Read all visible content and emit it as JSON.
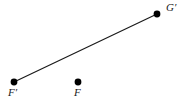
{
  "figure": {
    "width": 189,
    "height": 104,
    "background_color": "#ffffff",
    "stroke_color": "#1a1a1a",
    "points": [
      {
        "id": "F-prime",
        "label": "F′",
        "cx": 14,
        "cy": 82,
        "radius": 3.4,
        "fill": "#000000"
      },
      {
        "id": "F",
        "label": "F",
        "cx": 78,
        "cy": 82,
        "radius": 3.4,
        "fill": "#000000"
      },
      {
        "id": "G-prime",
        "label": "G′",
        "cx": 157,
        "cy": 14,
        "radius": 3.4,
        "fill": "#000000"
      }
    ],
    "segments": [
      {
        "id": "segment-F-prime-G-prime",
        "from": "F-prime",
        "to": "G-prime",
        "x1": 14,
        "y1": 82,
        "x2": 157,
        "y2": 14,
        "stroke": "#1a1a1a",
        "stroke_width": 1.2
      }
    ]
  }
}
